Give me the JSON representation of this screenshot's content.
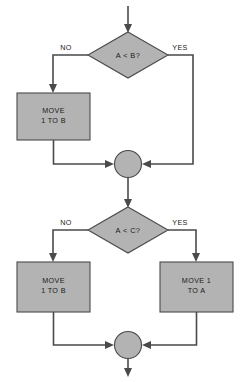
{
  "diagram": {
    "colors": {
      "shape_fill": "#b3b3b3",
      "shape_stroke": "#4a4a4a",
      "line": "#4a4a4a",
      "text": "#1a1a1a",
      "background": "#ffffff"
    },
    "nodes": {
      "entry_arrow": {
        "label": ""
      },
      "decision_1": {
        "label": "A < B?"
      },
      "decision_1_no": {
        "label": "NO"
      },
      "decision_1_yes": {
        "label": "YES"
      },
      "process_1": {
        "line1": "MOVE",
        "line2": "1 TO B"
      },
      "connector_1": {
        "label": ""
      },
      "decision_2": {
        "label": "A < C?"
      },
      "decision_2_no": {
        "label": "NO"
      },
      "decision_2_yes": {
        "label": "YES"
      },
      "process_2": {
        "line1": "MOVE",
        "line2": "1 TO B"
      },
      "process_3": {
        "line1": "MOVE 1",
        "line2": "TO A"
      },
      "connector_2": {
        "label": ""
      },
      "exit_arrow": {
        "label": ""
      }
    }
  }
}
